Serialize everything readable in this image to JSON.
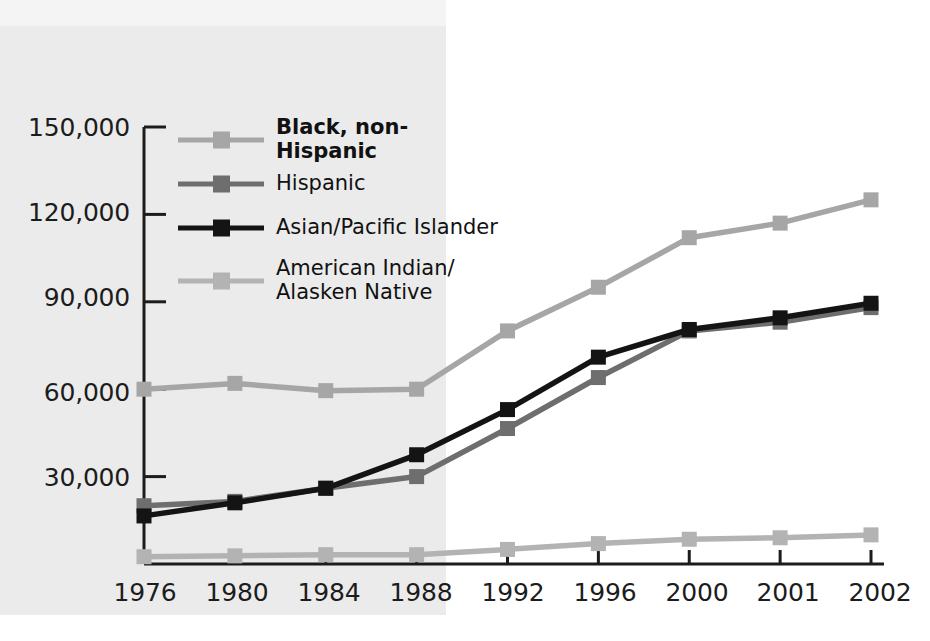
{
  "chart_data": {
    "type": "line",
    "title": "",
    "subtitle": "",
    "xlabel": "",
    "ylabel": "",
    "categories": [
      "1976",
      "1980",
      "1984",
      "1988",
      "1992",
      "1996",
      "2000",
      "2001",
      "2002"
    ],
    "ylim": [
      0,
      150000
    ],
    "yticks": [
      0,
      30000,
      60000,
      90000,
      120000,
      150000
    ],
    "ytick_labels": [
      "",
      "30,000",
      "60,000",
      "90,000",
      "120,000",
      "150,000"
    ],
    "grid": false,
    "legend_position": "upper-left-inside",
    "marker": "square",
    "series": [
      {
        "name": "Black, non-Hispanic",
        "color": "#a6a6a6",
        "bold_label": true,
        "values": [
          60000,
          62000,
          59500,
          60000,
          80000,
          95000,
          112000,
          117000,
          125000
        ]
      },
      {
        "name": "Hispanic",
        "color": "#6e6e6e",
        "bold_label": false,
        "values": [
          20000,
          21500,
          26000,
          30000,
          46500,
          64000,
          80000,
          83000,
          88000
        ]
      },
      {
        "name": "Asian/Pacific Islander",
        "color": "#141414",
        "bold_label": false,
        "values": [
          16500,
          21000,
          26000,
          37500,
          53000,
          71000,
          80500,
          84500,
          89500
        ]
      },
      {
        "name": "American Indian/\nAlasken Native",
        "color": "#b3b3b3",
        "bold_label": false,
        "values": [
          2500,
          2800,
          3200,
          3200,
          5000,
          7000,
          8500,
          9000,
          10000
        ]
      }
    ]
  },
  "axis": {
    "y_tick_labels": [
      "150,000",
      "120,000",
      "90,000",
      "60,000",
      "30,000"
    ],
    "x_tick_labels": [
      "1976",
      "1980",
      "1984",
      "1988",
      "1992",
      "1996",
      "2000",
      "2001",
      "2002"
    ]
  },
  "legend": {
    "items": [
      {
        "label": "Black, non-Hispanic",
        "color": "#a6a6a6",
        "bold": true
      },
      {
        "label": "Hispanic",
        "color": "#6e6e6e",
        "bold": false
      },
      {
        "label": "Asian/Pacific Islander",
        "color": "#141414",
        "bold": false
      },
      {
        "label": "American Indian/\nAlasken Native",
        "color": "#b3b3b3",
        "bold": false
      }
    ]
  },
  "colors": {
    "axis": "#1c1c1c",
    "background": "#ffffff",
    "page_tint": "#ebebeb"
  }
}
